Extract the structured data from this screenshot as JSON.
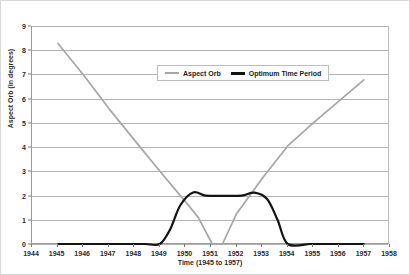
{
  "chart_data": {
    "type": "line",
    "title": "",
    "xlabel": "Time (1945 to 1957)",
    "ylabel": "Aspect Orb (in degrees)",
    "xlim": [
      1944,
      1958
    ],
    "ylim": [
      0,
      9
    ],
    "grid": "horizontal",
    "legend_position": "upper-center-right",
    "x_ticks": [
      "1944",
      "1945",
      "1946",
      "1947",
      "1948",
      "1949",
      "1950",
      "1951",
      "1952",
      "1953",
      "1954",
      "1955",
      "1956",
      "1957",
      "1958"
    ],
    "y_ticks": [
      "0",
      "1",
      "2",
      "3",
      "4",
      "5",
      "6",
      "7",
      "8",
      "9"
    ],
    "colors": {
      "aspect_orb": "#a6a6a6",
      "optimum_time_period": "#131313",
      "gridline": "#b3b3b3",
      "axis": "#9a9a9a"
    },
    "series": [
      {
        "name": "Aspect Orb",
        "color": "#a6a6a6",
        "points": [
          [
            1945.0,
            8.3
          ],
          [
            1946.0,
            7.0
          ],
          [
            1947.0,
            5.6
          ],
          [
            1948.0,
            4.3
          ],
          [
            1949.0,
            3.0
          ],
          [
            1950.0,
            1.75
          ],
          [
            1950.5,
            1.1
          ],
          [
            1951.05,
            0.0
          ],
          [
            1951.45,
            0.0
          ],
          [
            1952.0,
            1.25
          ],
          [
            1953.0,
            2.7
          ],
          [
            1954.0,
            4.05
          ],
          [
            1955.0,
            5.0
          ],
          [
            1956.0,
            5.9
          ],
          [
            1957.0,
            6.8
          ]
        ]
      },
      {
        "name": "Optimum Time Period",
        "color": "#131313",
        "points": [
          [
            1945.0,
            0.0
          ],
          [
            1946.0,
            0.0
          ],
          [
            1947.0,
            0.0
          ],
          [
            1948.0,
            0.0
          ],
          [
            1948.45,
            0.0
          ],
          [
            1949.0,
            0.0
          ],
          [
            1949.4,
            0.6
          ],
          [
            1949.8,
            1.6
          ],
          [
            1950.3,
            2.13
          ],
          [
            1950.8,
            2.0
          ],
          [
            1951.5,
            1.99
          ],
          [
            1952.2,
            2.0
          ],
          [
            1952.7,
            2.12
          ],
          [
            1953.2,
            1.85
          ],
          [
            1953.6,
            1.0
          ],
          [
            1954.0,
            0.0
          ],
          [
            1954.85,
            0.0
          ],
          [
            1955.0,
            0.0
          ],
          [
            1956.0,
            0.0
          ],
          [
            1957.0,
            0.0
          ]
        ]
      }
    ]
  },
  "legend": {
    "entries": [
      {
        "label": "Aspect Orb",
        "swatch": "gray"
      },
      {
        "label": "Optimum Time Period",
        "swatch": "black"
      }
    ]
  }
}
